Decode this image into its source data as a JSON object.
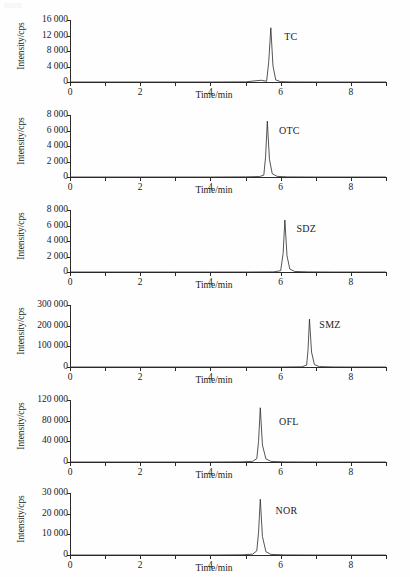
{
  "figure": {
    "axis_title_y": "Intensity/cps",
    "axis_title_x": "Time/min",
    "x_tick_labels": [
      "0",
      "2",
      "4",
      "6",
      "8"
    ],
    "x_tick_values": [
      0,
      2,
      4,
      6,
      8
    ],
    "line_color": "#2a2a2a",
    "axis_color": "#2a2a2a",
    "background": "#ffffff"
  },
  "chart_data": [
    {
      "type": "line",
      "title": "TC",
      "xlabel": "Time/min",
      "ylabel": "Intensity/cps",
      "xlim": [
        0,
        9
      ],
      "ylim": [
        0,
        16000
      ],
      "xticks": [
        0,
        1,
        2,
        3,
        4,
        5,
        6,
        7,
        8,
        9
      ],
      "xtick_labels": [
        "0",
        "",
        "2",
        "",
        "4",
        "",
        "6",
        "",
        "8",
        ""
      ],
      "yticks": [
        0,
        4000,
        8000,
        12000,
        16000
      ],
      "ytick_labels": [
        "0",
        "4 000",
        "8 000",
        "12 000",
        "16 000"
      ],
      "grid": false,
      "legend": "none",
      "annotation": "TC",
      "annotation_xy": [
        6.1,
        11500
      ],
      "peak": {
        "retention_time": 5.72,
        "height": 14000,
        "width": 0.075
      },
      "shoulder": {
        "retention_time": 5.45,
        "height": 450,
        "width": 0.18
      },
      "x": [
        0,
        1,
        2,
        3,
        4,
        5,
        5.45,
        5.6,
        5.66,
        5.72,
        5.78,
        5.86,
        6.0,
        6.3,
        7,
        8,
        9
      ],
      "y": [
        0,
        0,
        0,
        0,
        0,
        40,
        450,
        180,
        5200,
        14000,
        4200,
        520,
        90,
        20,
        0,
        0,
        0
      ]
    },
    {
      "type": "line",
      "title": "OTC",
      "xlabel": "Time/min",
      "ylabel": "Intensity/cps",
      "xlim": [
        0,
        9
      ],
      "ylim": [
        0,
        8000
      ],
      "xticks": [
        0,
        1,
        2,
        3,
        4,
        5,
        6,
        7,
        8,
        9
      ],
      "xtick_labels": [
        "0",
        "",
        "2",
        "",
        "4",
        "",
        "6",
        "",
        "8",
        ""
      ],
      "yticks": [
        0,
        2000,
        4000,
        6000,
        8000
      ],
      "ytick_labels": [
        "0",
        "2 000",
        "4 000",
        "6 000",
        "8 000"
      ],
      "grid": false,
      "legend": "none",
      "annotation": "OTC",
      "annotation_xy": [
        5.95,
        6000
      ],
      "peak": {
        "retention_time": 5.62,
        "height": 7200,
        "width": 0.07
      },
      "x": [
        0,
        1,
        2,
        3,
        4,
        5,
        5.4,
        5.52,
        5.57,
        5.62,
        5.68,
        5.76,
        5.9,
        6.2,
        7,
        8,
        9
      ],
      "y": [
        0,
        0,
        0,
        0,
        0,
        20,
        60,
        240,
        2600,
        7200,
        2300,
        420,
        80,
        15,
        0,
        0,
        0
      ]
    },
    {
      "type": "line",
      "title": "SDZ",
      "xlabel": "Time/min",
      "ylabel": "Intensity/cps",
      "xlim": [
        0,
        9
      ],
      "ylim": [
        0,
        8000
      ],
      "xticks": [
        0,
        1,
        2,
        3,
        4,
        5,
        6,
        7,
        8,
        9
      ],
      "xtick_labels": [
        "0",
        "",
        "2",
        "",
        "4",
        "",
        "6",
        "",
        "8",
        ""
      ],
      "yticks": [
        0,
        2000,
        4000,
        6000,
        8000
      ],
      "ytick_labels": [
        "0",
        "2 000",
        "4 000",
        "6 000",
        "8 000"
      ],
      "grid": false,
      "legend": "none",
      "annotation": "SDZ",
      "annotation_xy": [
        6.45,
        5600
      ],
      "peak": {
        "retention_time": 6.12,
        "height": 6700,
        "width": 0.06
      },
      "x": [
        0,
        1,
        2,
        3,
        4,
        5,
        5.8,
        6.0,
        6.07,
        6.12,
        6.18,
        6.26,
        6.4,
        6.8,
        7.5,
        8,
        9
      ],
      "y": [
        0,
        0,
        0,
        0,
        0,
        0,
        20,
        160,
        2400,
        6700,
        2100,
        380,
        70,
        15,
        0,
        0,
        0
      ]
    },
    {
      "type": "line",
      "title": "SMZ",
      "xlabel": "Time/min",
      "ylabel": "Intensity/cps",
      "xlim": [
        0,
        9
      ],
      "ylim": [
        0,
        300000
      ],
      "xticks": [
        0,
        1,
        2,
        3,
        4,
        5,
        6,
        7,
        8,
        9
      ],
      "xtick_labels": [
        "0",
        "",
        "2",
        "",
        "4",
        "",
        "6",
        "",
        "8",
        ""
      ],
      "yticks": [
        0,
        100000,
        200000,
        300000
      ],
      "ytick_labels": [
        "0",
        "100 000",
        "200 000",
        "300 000"
      ],
      "grid": false,
      "legend": "none",
      "annotation": "SMZ",
      "annotation_xy": [
        7.1,
        205000
      ],
      "peak": {
        "retention_time": 6.82,
        "height": 232000,
        "width": 0.065
      },
      "x": [
        0,
        1,
        2,
        3,
        4,
        5,
        6,
        6.6,
        6.74,
        6.78,
        6.82,
        6.88,
        6.96,
        7.1,
        7.5,
        8,
        9
      ],
      "y": [
        0,
        0,
        0,
        0,
        0,
        0,
        0,
        1000,
        9000,
        85000,
        232000,
        72000,
        12000,
        2000,
        300,
        0,
        0
      ]
    },
    {
      "type": "line",
      "title": "OFL",
      "xlabel": "Time/min",
      "ylabel": "Intensity/cps",
      "xlim": [
        0,
        9
      ],
      "ylim": [
        0,
        120000
      ],
      "xticks": [
        0,
        1,
        2,
        3,
        4,
        5,
        6,
        7,
        8,
        9
      ],
      "xtick_labels": [
        "0",
        "",
        "2",
        "",
        "4",
        "",
        "6",
        "",
        "8",
        ""
      ],
      "yticks": [
        0,
        40000,
        80000,
        120000
      ],
      "ytick_labels": [
        "0",
        "40 000",
        "80 000",
        "120 000"
      ],
      "grid": false,
      "legend": "none",
      "annotation": "OFL",
      "annotation_xy": [
        5.95,
        78000
      ],
      "peak": {
        "retention_time": 5.42,
        "height": 105000,
        "width": 0.07
      },
      "x": [
        0,
        1,
        2,
        3,
        4,
        4.9,
        5.2,
        5.32,
        5.37,
        5.42,
        5.48,
        5.58,
        5.72,
        6.1,
        7,
        8,
        9
      ],
      "y": [
        0,
        0,
        0,
        0,
        0,
        300,
        1200,
        6500,
        40000,
        105000,
        33000,
        6000,
        1200,
        200,
        0,
        0,
        0
      ]
    },
    {
      "type": "line",
      "title": "NOR",
      "xlabel": "Time/min",
      "ylabel": "Intensity/cps",
      "xlim": [
        0,
        9
      ],
      "ylim": [
        0,
        30000
      ],
      "xticks": [
        0,
        1,
        2,
        3,
        4,
        5,
        6,
        7,
        8,
        9
      ],
      "xtick_labels": [
        "0",
        "",
        "2",
        "",
        "4",
        "",
        "6",
        "",
        "8",
        ""
      ],
      "yticks": [
        0,
        10000,
        20000,
        30000
      ],
      "ytick_labels": [
        "0",
        "10 000",
        "20 000",
        "30 000"
      ],
      "grid": false,
      "legend": "none",
      "annotation": "NOR",
      "annotation_xy": [
        5.85,
        21500
      ],
      "peak": {
        "retention_time": 5.42,
        "height": 27000,
        "width": 0.07
      },
      "x": [
        0,
        1,
        2,
        3,
        4,
        4.9,
        5.2,
        5.32,
        5.37,
        5.42,
        5.48,
        5.58,
        5.72,
        6.1,
        7,
        8,
        9
      ],
      "y": [
        0,
        0,
        0,
        0,
        0,
        100,
        400,
        2000,
        11000,
        27000,
        9000,
        1600,
        300,
        60,
        0,
        0,
        0
      ]
    }
  ]
}
